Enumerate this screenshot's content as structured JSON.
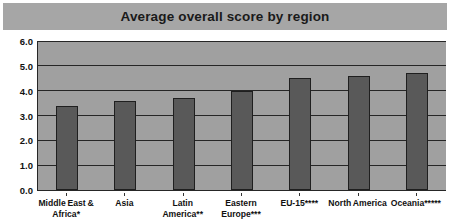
{
  "chart_data": {
    "type": "bar",
    "title": "Average overall score by region",
    "xlabel": "",
    "ylabel": "",
    "ylim": [
      0.0,
      6.0
    ],
    "ytick_labels": [
      "0.0",
      "1.0",
      "2.0",
      "3.0",
      "4.0",
      "5.0",
      "6.0"
    ],
    "ytick_values": [
      0.0,
      1.0,
      2.0,
      3.0,
      4.0,
      5.0,
      6.0
    ],
    "grid": true,
    "legend": false,
    "categories": [
      "Middle East & Africa*",
      "Asia",
      "Latin America**",
      "Eastern Europe***",
      "EU-15****",
      "North America",
      "Oceania*****"
    ],
    "category_lines": [
      [
        "Middle East &",
        "Africa*"
      ],
      [
        "Asia",
        ""
      ],
      [
        "Latin",
        "America**"
      ],
      [
        "Eastern",
        "Europe***"
      ],
      [
        "EU-15****",
        ""
      ],
      [
        "North America",
        ""
      ],
      [
        "Oceania*****",
        ""
      ]
    ],
    "values": [
      3.4,
      3.6,
      3.7,
      4.0,
      4.5,
      4.6,
      4.7
    ]
  },
  "colors": {
    "title_banner": "#a6a6a6",
    "plot_background": "#a0a0a0",
    "bar_fill": "#595959",
    "bar_edge": "#1f1f1f",
    "gridline": "#262626",
    "text": "#111111",
    "page_background": "#ffffff"
  }
}
